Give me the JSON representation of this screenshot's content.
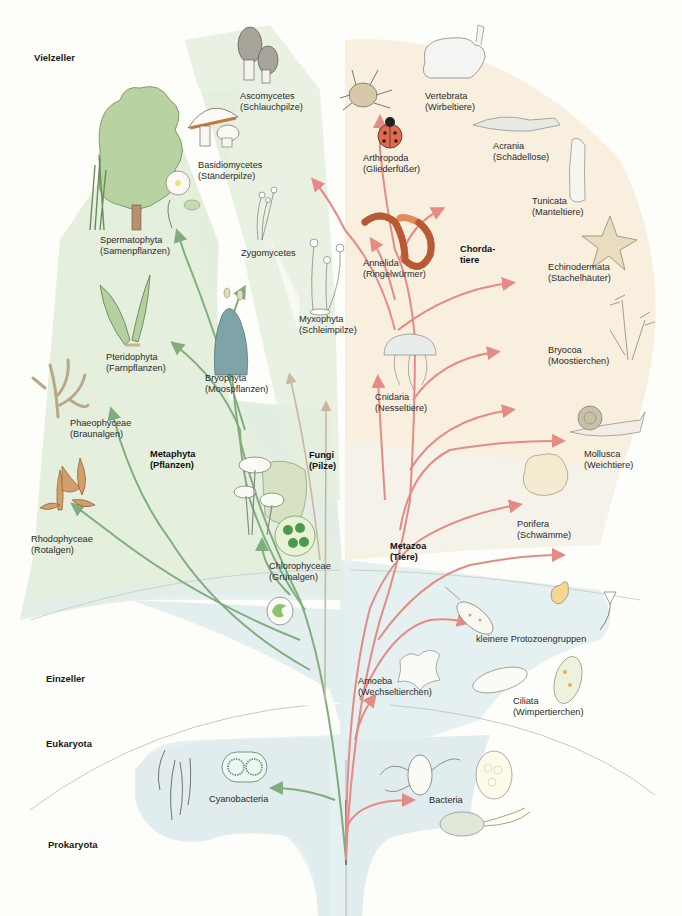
{
  "zones": {
    "vielzeller": "Vielzeller",
    "einzeller": "Einzeller",
    "eukaryota": "Eukaryota",
    "prokaryota": "Prokaryota"
  },
  "kingdoms": {
    "metaphyta": {
      "name": "Metaphyta",
      "common": "(Pflanzen)"
    },
    "fungi": {
      "name": "Fungi",
      "common": "(Pilze)"
    },
    "metazoa": {
      "name": "Metazoa",
      "common": "(Tiere)"
    },
    "chordata": {
      "name": "Chorda-",
      "common": "tiere"
    }
  },
  "taxa": {
    "ascomycetes": {
      "name": "Ascomycetes",
      "common": "(Schlauchpilze)"
    },
    "basidiomycetes": {
      "name": "Basidiomycetes",
      "common": "(Ständerpilze)"
    },
    "spermatophyta": {
      "name": "Spermatophyta",
      "common": "(Samenpflanzen)"
    },
    "zygomycetes": {
      "name": "Zygomycetes"
    },
    "myxophyta": {
      "name": "Myxophyta",
      "common": "(Schleimpilze)"
    },
    "pteridophyta": {
      "name": "Pteridophyta",
      "common": "(Farnpflanzen)"
    },
    "bryophyta": {
      "name": "Bryophyta",
      "common": "(Moospflanzen)"
    },
    "phaeophyceae": {
      "name": "Phaeophyceae",
      "common": "(Braunalgen)"
    },
    "rhodophyceae": {
      "name": "Rhodophyceae",
      "common": "(Rotalgen)"
    },
    "chlorophyceae": {
      "name": "Chlorophyceae",
      "common": "(Grünalgen)"
    },
    "vertebrata": {
      "name": "Vertebrata",
      "common": "(Wirbeltiere)"
    },
    "arthropoda": {
      "name": "Arthropoda",
      "common": "(Gliederfüßer)"
    },
    "acrania": {
      "name": "Acrania",
      "common": "(Schädellose)"
    },
    "tunicata": {
      "name": "Tunicata",
      "common": "(Manteltiere)"
    },
    "annelida": {
      "name": "Annelida",
      "common": "(Ringelwürmer)"
    },
    "echinodermata": {
      "name": "Echinodermata",
      "common": "(Stachelhäuter)"
    },
    "bryocoa": {
      "name": "Bryocoa",
      "common": "(Moostierchen)"
    },
    "cnidaria": {
      "name": "Cnidaria",
      "common": "(Nesseltiere)"
    },
    "mollusca": {
      "name": "Mollusca",
      "common": "(Weichtiere)"
    },
    "porifera": {
      "name": "Porifera",
      "common": "(Schwämme)"
    },
    "protozoa": {
      "name": "kleinere Protozoengruppen"
    },
    "amoeba": {
      "name": "Amoeba",
      "common": "(Wechseltierchen)"
    },
    "ciliata": {
      "name": "Ciliata",
      "common": "(Wimpertierchen)"
    },
    "cyanobacteria": {
      "name": "Cyanobacteria"
    },
    "bacteria": {
      "name": "Bacteria"
    }
  },
  "colors": {
    "plant_branch": "#7fae7c",
    "fungi_branch": "#c9b7a0",
    "animal_branch": "#e58a84",
    "plant_bg": "#e3eedd",
    "animal_bg": "#f8eedd",
    "single_cell_bg": "#e2eef0"
  }
}
